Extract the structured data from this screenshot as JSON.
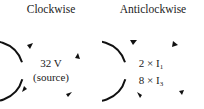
{
  "diagram": {
    "panels": [
      {
        "title": "Clockwise",
        "direction": "clockwise",
        "lines": [
          "32 V",
          "(source)"
        ]
      },
      {
        "title": "Anticlockwise",
        "direction": "anticlockwise",
        "terms": [
          {
            "coef": "2 × I",
            "sub": "1"
          },
          {
            "coef": "8 × I",
            "sub": "3"
          }
        ]
      }
    ],
    "stroke_color": "#111111"
  }
}
